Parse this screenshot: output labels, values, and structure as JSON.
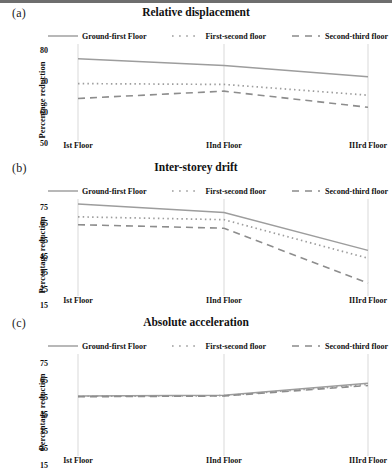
{
  "figure": {
    "ylabel": "Percentage reduction",
    "xticks": [
      "Ist Floor",
      "IInd Floor",
      "IIIrd Floor"
    ],
    "legend": [
      {
        "label": "Ground-first Floor",
        "style": "solid",
        "color": "#9a9a9a",
        "icon": "solid-line-swatch"
      },
      {
        "label": "First-second floor",
        "style": "dotted",
        "color": "#9a9a9a",
        "icon": "dotted-line-swatch"
      },
      {
        "label": "Second-third floor",
        "style": "dashed",
        "color": "#8a8a8a",
        "icon": "dashed-line-swatch"
      }
    ],
    "panels": [
      {
        "letter": "(a)",
        "title": "Relative displacement"
      },
      {
        "letter": "(b)",
        "title": "Inter-storey drift"
      },
      {
        "letter": "(c)",
        "title": "Absolute acceleration"
      }
    ]
  },
  "chart_data": [
    {
      "type": "line",
      "panel": "(a)",
      "title": "Relative displacement",
      "xlabel": "",
      "ylabel": "Percentage reduction",
      "categories": [
        "Ist Floor",
        "IInd Floor",
        "IIIrd Floor"
      ],
      "yticks": [
        50,
        60,
        70,
        80
      ],
      "ylim": [
        46,
        82
      ],
      "grid": false,
      "legend_position": "top",
      "series": [
        {
          "name": "Ground-first Floor",
          "style": "solid",
          "values": [
            76.5,
            74.0,
            69.8
          ]
        },
        {
          "name": "First-second floor",
          "style": "dotted",
          "values": [
            67.3,
            67.0,
            63.0
          ]
        },
        {
          "name": "Second-third floor",
          "style": "dashed",
          "values": [
            61.8,
            64.5,
            58.5
          ]
        }
      ]
    },
    {
      "type": "line",
      "panel": "(b)",
      "title": "Inter-storey drift",
      "xlabel": "",
      "ylabel": "Percentage reduction",
      "categories": [
        "Ist Floor",
        "IInd Floor",
        "IIIrd Floor"
      ],
      "yticks": [
        15,
        25,
        35,
        45,
        55,
        65,
        75
      ],
      "ylim": [
        12,
        80
      ],
      "grid": false,
      "legend_position": "top",
      "series": [
        {
          "name": "Ground-first Floor",
          "style": "solid",
          "values": [
            76.5,
            70.5,
            44.0
          ]
        },
        {
          "name": "First-second floor",
          "style": "dotted",
          "values": [
            67.5,
            65.5,
            38.5
          ]
        },
        {
          "name": "Second-third floor",
          "style": "dashed",
          "values": [
            62.0,
            59.5,
            21.0
          ]
        }
      ]
    },
    {
      "type": "line",
      "panel": "(c)",
      "title": "Absolute acceleration",
      "xlabel": "",
      "ylabel": "Percentage reduction",
      "categories": [
        "Ist Floor",
        "IInd Floor",
        "IIIrd Floor"
      ],
      "yticks": [
        15,
        25,
        35,
        45,
        55,
        65,
        75
      ],
      "ylim": [
        12,
        80
      ],
      "grid": false,
      "legend_position": "top",
      "series": [
        {
          "name": "Ground-first Floor",
          "style": "solid",
          "values": [
            52.0,
            52.5,
            60.5
          ]
        },
        {
          "name": "First-second floor",
          "style": "dotted",
          "values": [
            51.8,
            52.2,
            59.8
          ]
        },
        {
          "name": "Second-third floor",
          "style": "dashed",
          "values": [
            51.5,
            52.0,
            59.0
          ]
        }
      ]
    }
  ]
}
